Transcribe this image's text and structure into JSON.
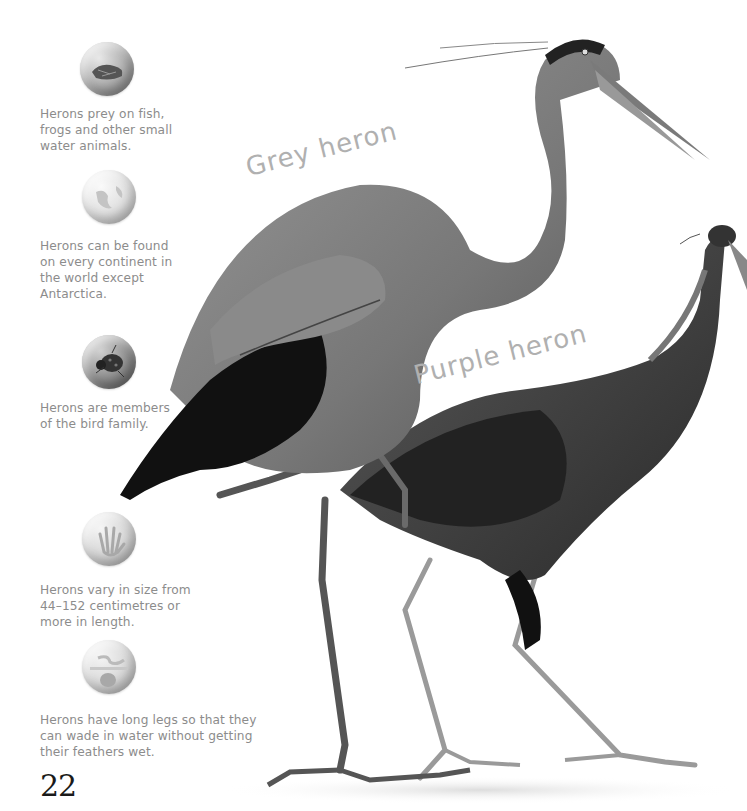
{
  "page": {
    "page_number": "22",
    "background": "#ffffff"
  },
  "labels": {
    "grey_heron": "Grey heron",
    "purple_heron": "Purple heron"
  },
  "facts": [
    {
      "icon": "food-fish-icon",
      "text": "Herons prey on fish,\nfrogs and other small\nwater animals."
    },
    {
      "icon": "globe-icon",
      "text": "Herons can be found\non every continent in\nthe world except\nAntarctica."
    },
    {
      "icon": "ladybird-icon",
      "text": "Herons are members\nof the bird family."
    },
    {
      "icon": "hand-size-icon",
      "text": "Herons vary in size from\n44–152 centimetres or\nmore in length."
    },
    {
      "icon": "habitat-icon",
      "text": "Herons have long legs so that they\ncan wade in water without getting\ntheir feathers wet."
    }
  ],
  "colors": {
    "fact_text": "#8c8c8c",
    "label_text": "#b0b0b0",
    "page_number": "#1a1a1a"
  }
}
